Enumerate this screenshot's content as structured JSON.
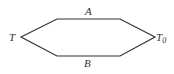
{
  "diagram": {
    "shape": "hexagon",
    "stroke_color": "#333333",
    "vertices": [
      [
        21,
        37
      ],
      [
        57,
        19
      ],
      [
        120,
        19
      ],
      [
        155,
        37
      ],
      [
        120,
        56
      ],
      [
        57,
        56
      ]
    ],
    "labels": {
      "top_edge": "A",
      "bottom_edge": "B",
      "left_vertex": "T",
      "right_vertex_base": "T",
      "right_vertex_subscript": "0"
    }
  }
}
